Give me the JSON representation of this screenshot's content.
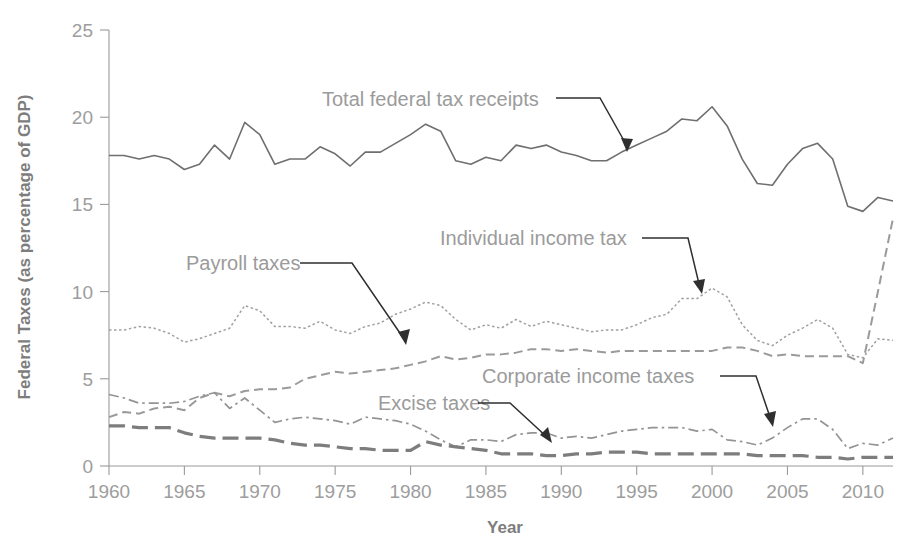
{
  "chart_data": {
    "type": "line",
    "title": "",
    "xlabel": "Year",
    "ylabel": "Federal Taxes (as percentage of GDP)",
    "xlim": [
      1960,
      2012
    ],
    "ylim": [
      0,
      25
    ],
    "xticks": [
      1960,
      1965,
      1970,
      1975,
      1980,
      1985,
      1990,
      1995,
      2000,
      2005,
      2010
    ],
    "yticks": [
      0,
      5,
      10,
      15,
      20,
      25
    ],
    "grid": false,
    "legend_position": "inline-annotations",
    "series": [
      {
        "name": "Total federal tax receipts",
        "style": "solid",
        "color": "#6f6f6f",
        "x": [
          1960,
          1961,
          1962,
          1963,
          1964,
          1965,
          1966,
          1967,
          1968,
          1969,
          1970,
          1971,
          1972,
          1973,
          1974,
          1975,
          1976,
          1977,
          1978,
          1979,
          1980,
          1981,
          1982,
          1983,
          1984,
          1985,
          1986,
          1987,
          1988,
          1989,
          1990,
          1991,
          1992,
          1993,
          1994,
          1995,
          1996,
          1997,
          1998,
          1999,
          2000,
          2001,
          2002,
          2003,
          2004,
          2005,
          2006,
          2007,
          2008,
          2009,
          2010,
          2011,
          2012
        ],
        "values": [
          17.8,
          17.8,
          17.6,
          17.8,
          17.6,
          17.0,
          17.3,
          18.4,
          17.6,
          19.7,
          19.0,
          17.3,
          17.6,
          17.6,
          18.3,
          17.9,
          17.2,
          18.0,
          18.0,
          18.5,
          19.0,
          19.6,
          19.2,
          17.5,
          17.3,
          17.7,
          17.5,
          18.4,
          18.2,
          18.4,
          18.0,
          17.8,
          17.5,
          17.5,
          18.0,
          18.4,
          18.8,
          19.2,
          19.9,
          19.8,
          20.6,
          19.5,
          17.6,
          16.2,
          16.1,
          17.3,
          18.2,
          18.5,
          17.6,
          14.9,
          14.6,
          15.4,
          15.2
        ]
      },
      {
        "name": "Individual income tax",
        "style": "dotted",
        "color": "#a0a0a0",
        "x": [
          1960,
          1961,
          1962,
          1963,
          1964,
          1965,
          1966,
          1967,
          1968,
          1969,
          1970,
          1971,
          1972,
          1973,
          1974,
          1975,
          1976,
          1977,
          1978,
          1979,
          1980,
          1981,
          1982,
          1983,
          1984,
          1985,
          1986,
          1987,
          1988,
          1989,
          1990,
          1991,
          1992,
          1993,
          1994,
          1995,
          1996,
          1997,
          1998,
          1999,
          2000,
          2001,
          2002,
          2003,
          2004,
          2005,
          2006,
          2007,
          2008,
          2009,
          2010,
          2011,
          2012
        ],
        "values": [
          7.8,
          7.8,
          8.0,
          7.9,
          7.6,
          7.1,
          7.3,
          7.6,
          7.9,
          9.2,
          8.9,
          8.0,
          8.0,
          7.9,
          8.3,
          7.8,
          7.6,
          8.0,
          8.2,
          8.7,
          9.0,
          9.4,
          9.2,
          8.4,
          7.8,
          8.1,
          7.9,
          8.4,
          8.0,
          8.3,
          8.1,
          7.9,
          7.7,
          7.8,
          7.8,
          8.1,
          8.5,
          8.7,
          9.6,
          9.6,
          10.2,
          9.7,
          8.1,
          7.2,
          6.9,
          7.5,
          7.9,
          8.4,
          7.9,
          6.4,
          6.2,
          7.3,
          7.2
        ]
      },
      {
        "name": "Payroll taxes",
        "style": "dashed",
        "color": "#9a9a9a",
        "x": [
          1960,
          1961,
          1962,
          1963,
          1964,
          1965,
          1966,
          1967,
          1968,
          1969,
          1970,
          1971,
          1972,
          1973,
          1974,
          1975,
          1976,
          1977,
          1978,
          1979,
          1980,
          1981,
          1982,
          1983,
          1984,
          1985,
          1986,
          1987,
          1988,
          1989,
          1990,
          1991,
          1992,
          1993,
          1994,
          1995,
          1996,
          1997,
          1998,
          1999,
          2000,
          2001,
          2002,
          2003,
          2004,
          2005,
          2006,
          2007,
          2008,
          2009,
          2010,
          2011,
          2012
        ],
        "values": [
          2.8,
          3.1,
          3.0,
          3.3,
          3.4,
          3.2,
          3.9,
          4.2,
          4.0,
          4.3,
          4.4,
          4.4,
          4.5,
          5.0,
          5.2,
          5.4,
          5.3,
          5.4,
          5.5,
          5.6,
          5.8,
          6.0,
          6.3,
          6.1,
          6.2,
          6.4,
          6.4,
          6.5,
          6.7,
          6.7,
          6.6,
          6.7,
          6.6,
          6.5,
          6.6,
          6.6,
          6.6,
          6.6,
          6.6,
          6.6,
          6.6,
          6.8,
          6.8,
          6.6,
          6.3,
          6.4,
          6.3,
          6.3,
          6.3,
          6.3,
          5.9,
          10.0,
          14.2
        ]
      },
      {
        "name": "Corporate income taxes",
        "style": "dashdot",
        "color": "#949494",
        "x": [
          1960,
          1961,
          1962,
          1963,
          1964,
          1965,
          1966,
          1967,
          1968,
          1969,
          1970,
          1971,
          1972,
          1973,
          1974,
          1975,
          1976,
          1977,
          1978,
          1979,
          1980,
          1981,
          1982,
          1983,
          1984,
          1985,
          1986,
          1987,
          1988,
          1989,
          1990,
          1991,
          1992,
          1993,
          1994,
          1995,
          1996,
          1997,
          1998,
          1999,
          2000,
          2001,
          2002,
          2003,
          2004,
          2005,
          2006,
          2007,
          2008,
          2009,
          2010,
          2011,
          2012
        ],
        "values": [
          4.1,
          3.9,
          3.6,
          3.6,
          3.6,
          3.7,
          4.0,
          4.2,
          3.3,
          3.9,
          3.2,
          2.5,
          2.7,
          2.8,
          2.7,
          2.6,
          2.4,
          2.8,
          2.7,
          2.6,
          2.4,
          2.0,
          1.5,
          1.1,
          1.5,
          1.5,
          1.4,
          1.8,
          1.9,
          1.9,
          1.6,
          1.7,
          1.6,
          1.8,
          2.0,
          2.1,
          2.2,
          2.2,
          2.2,
          2.0,
          2.1,
          1.5,
          1.4,
          1.2,
          1.6,
          2.2,
          2.7,
          2.7,
          2.1,
          1.0,
          1.3,
          1.2,
          1.6
        ]
      },
      {
        "name": "Excise taxes",
        "style": "longdash",
        "color": "#7d7d7d",
        "x": [
          1960,
          1961,
          1962,
          1963,
          1964,
          1965,
          1966,
          1967,
          1968,
          1969,
          1970,
          1971,
          1972,
          1973,
          1974,
          1975,
          1976,
          1977,
          1978,
          1979,
          1980,
          1981,
          1982,
          1983,
          1984,
          1985,
          1986,
          1987,
          1988,
          1989,
          1990,
          1991,
          1992,
          1993,
          1994,
          1995,
          1996,
          1997,
          1998,
          1999,
          2000,
          2001,
          2002,
          2003,
          2004,
          2005,
          2006,
          2007,
          2008,
          2009,
          2010,
          2011,
          2012
        ],
        "values": [
          2.3,
          2.3,
          2.2,
          2.2,
          2.2,
          1.9,
          1.7,
          1.6,
          1.6,
          1.6,
          1.6,
          1.5,
          1.3,
          1.2,
          1.2,
          1.1,
          1.0,
          1.0,
          0.9,
          0.9,
          0.9,
          1.4,
          1.2,
          1.1,
          1.0,
          0.9,
          0.7,
          0.7,
          0.7,
          0.6,
          0.6,
          0.7,
          0.7,
          0.8,
          0.8,
          0.8,
          0.7,
          0.7,
          0.7,
          0.7,
          0.7,
          0.7,
          0.7,
          0.6,
          0.6,
          0.6,
          0.6,
          0.5,
          0.5,
          0.4,
          0.5,
          0.5,
          0.5
        ]
      }
    ],
    "annotations": [
      {
        "id": "total-federal-tax-receipts",
        "text": "Total federal tax receipts",
        "label_x": 322,
        "label_y": 106,
        "leader": "M 556,98 L 600,98 L 627,146",
        "arrow": "M 627,152 L 621,138 L 633,139 Z"
      },
      {
        "id": "payroll-taxes",
        "text": "Payroll taxes",
        "label_x": 186,
        "label_y": 270,
        "leader": "M 300,263 L 352,263 L 404,339",
        "arrow": "M 406,345 L 398,332 L 410,329 Z"
      },
      {
        "id": "individual-income-tax",
        "text": "Individual income tax",
        "label_x": 440,
        "label_y": 245,
        "leader": "M 642,238 L 688,238 L 700,288",
        "arrow": "M 702,294 L 693,281 L 705,279 Z"
      },
      {
        "id": "corporate-income-taxes",
        "text": "Corporate income taxes",
        "label_x": 482,
        "label_y": 383,
        "leader": "M 720,376 L 756,376 L 771,420",
        "arrow": "M 773,427 L 764,414 L 776,411 Z"
      },
      {
        "id": "excise-taxes",
        "text": "Excise taxes",
        "label_x": 378,
        "label_y": 410,
        "leader": "M 478,403 L 510,403 L 548,438",
        "arrow": "M 552,443 L 540,435 L 548,427 Z"
      }
    ]
  },
  "axes": {
    "y_title": "Federal Taxes (as percentage of GDP)",
    "x_title": "Year",
    "y_tick_labels": [
      "0",
      "5",
      "10",
      "15",
      "20",
      "25"
    ],
    "x_tick_labels": [
      "1960",
      "1965",
      "1970",
      "1975",
      "1980",
      "1985",
      "1990",
      "1995",
      "2000",
      "2005",
      "2010"
    ]
  },
  "colors": {
    "background": "#ffffff",
    "axis": "#9a9a9a",
    "text": "#9b9b9b",
    "leader": "#2f2f2f"
  }
}
